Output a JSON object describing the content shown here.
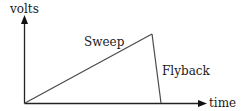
{
  "diagram": {
    "axes": {
      "y_label": "volts",
      "x_label": "time"
    },
    "segments": [
      {
        "name": "sweep",
        "label": "Sweep"
      },
      {
        "name": "flyback",
        "label": "Flyback"
      }
    ],
    "colors": {
      "background": "#ffffff",
      "line": "#4a4a4a",
      "axis": "#222222",
      "text": "#1a1a1a"
    }
  }
}
